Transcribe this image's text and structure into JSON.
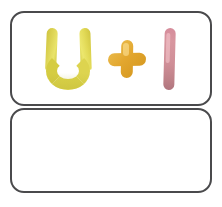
{
  "card": {
    "prompt_box": {
      "label": "Prompt box",
      "equation_text": "U + I",
      "glyphs": [
        {
          "name": "letter-u",
          "text": "U",
          "color": "#d9d24e",
          "material": "yellow-green clay"
        },
        {
          "name": "plus-sign",
          "text": "+",
          "color": "#e3a72f",
          "material": "golden amber clay"
        },
        {
          "name": "letter-i",
          "text": "I",
          "color": "#cf8e97",
          "material": "dusty pink clay"
        }
      ]
    },
    "answer_box": {
      "label": "Answer box",
      "content": ""
    },
    "colors": {
      "border": "#4a4a4c",
      "background": "#ffffff",
      "letter_u": "#d9d24e",
      "plus_sign": "#e3a72f",
      "letter_i": "#cf8e97"
    }
  }
}
